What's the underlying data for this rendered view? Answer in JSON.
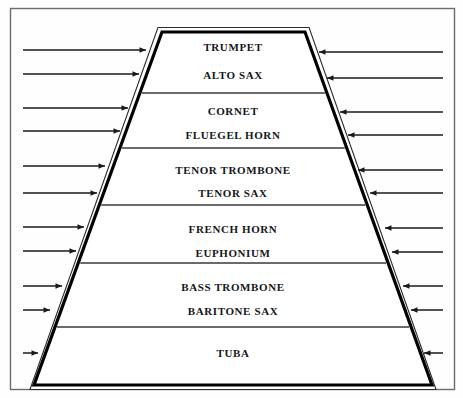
{
  "diagram": {
    "shape": "trapezoid",
    "frame": {
      "color": "#5a5a5a"
    },
    "trapezoid": {
      "outline_color": "#000000",
      "fill_color": "#ffffff",
      "top_left_x": 162,
      "top_right_x": 305,
      "top_y": 32,
      "bottom_left_x": 34,
      "bottom_right_x": 432,
      "bottom_y": 385
    },
    "divider_color": "#3a3a3a",
    "arrow_color": "#1a1a1a",
    "bands": [
      {
        "name": "band-top",
        "top_y": 32,
        "bottom_y": 93,
        "labels": [
          "TRUMPET",
          "ALTO SAX"
        ]
      },
      {
        "name": "band-second",
        "top_y": 93,
        "bottom_y": 148,
        "labels": [
          "CORNET",
          "FLUEGEL HORN"
        ]
      },
      {
        "name": "band-third",
        "top_y": 148,
        "bottom_y": 205,
        "labels": [
          "TENOR TROMBONE",
          "TENOR SAX"
        ]
      },
      {
        "name": "band-fourth",
        "top_y": 205,
        "bottom_y": 263,
        "labels": [
          "FRENCH HORN",
          "EUPHONIUM"
        ]
      },
      {
        "name": "band-fifth",
        "top_y": 263,
        "bottom_y": 327,
        "labels": [
          "BASS TROMBONE",
          "BARITONE SAX"
        ]
      },
      {
        "name": "band-bottom",
        "top_y": 327,
        "bottom_y": 385,
        "labels": [
          "TUBA"
        ]
      }
    ],
    "label_rows": [
      {
        "text": "TRUMPET",
        "y": 48,
        "center_x": 233
      },
      {
        "text": "ALTO SAX",
        "y": 76,
        "center_x": 233
      },
      {
        "text": "CORNET",
        "y": 112,
        "center_x": 233
      },
      {
        "text": "FLUEGEL HORN",
        "y": 136,
        "center_x": 233
      },
      {
        "text": "TENOR TROMBONE",
        "y": 171,
        "center_x": 233
      },
      {
        "text": "TENOR SAX",
        "y": 194,
        "center_x": 233
      },
      {
        "text": "FRENCH HORN",
        "y": 230,
        "center_x": 233
      },
      {
        "text": "EUPHONIUM",
        "y": 254,
        "center_x": 233
      },
      {
        "text": "BASS TROMBONE",
        "y": 288,
        "center_x": 233
      },
      {
        "text": "BARITONE SAX",
        "y": 312,
        "center_x": 233
      },
      {
        "text": "TUBA",
        "y": 354,
        "center_x": 233
      }
    ],
    "arrows_left": [
      {
        "y": 50,
        "x_start": 23,
        "x_end": 146
      },
      {
        "y": 74,
        "x_start": 23,
        "x_end": 139
      },
      {
        "y": 108,
        "x_start": 23,
        "x_end": 128
      },
      {
        "y": 131,
        "x_start": 23,
        "x_end": 120
      },
      {
        "y": 166,
        "x_start": 23,
        "x_end": 105
      },
      {
        "y": 193,
        "x_start": 23,
        "x_end": 97
      },
      {
        "y": 227,
        "x_start": 23,
        "x_end": 84
      },
      {
        "y": 251,
        "x_start": 23,
        "x_end": 76
      },
      {
        "y": 286,
        "x_start": 23,
        "x_end": 62
      },
      {
        "y": 310,
        "x_start": 23,
        "x_end": 50
      },
      {
        "y": 353,
        "x_start": 23,
        "x_end": 38
      }
    ],
    "arrows_right": [
      {
        "y": 52,
        "x_start": 443,
        "x_end": 319
      },
      {
        "y": 78,
        "x_start": 443,
        "x_end": 327
      },
      {
        "y": 112,
        "x_start": 443,
        "x_end": 340
      },
      {
        "y": 135,
        "x_start": 443,
        "x_end": 348
      },
      {
        "y": 170,
        "x_start": 443,
        "x_end": 358
      },
      {
        "y": 193,
        "x_start": 443,
        "x_end": 370
      },
      {
        "y": 228,
        "x_start": 443,
        "x_end": 385
      },
      {
        "y": 252,
        "x_start": 443,
        "x_end": 392
      },
      {
        "y": 286,
        "x_start": 443,
        "x_end": 403
      },
      {
        "y": 310,
        "x_start": 443,
        "x_end": 411
      },
      {
        "y": 353,
        "x_start": 443,
        "x_end": 424
      }
    ]
  }
}
